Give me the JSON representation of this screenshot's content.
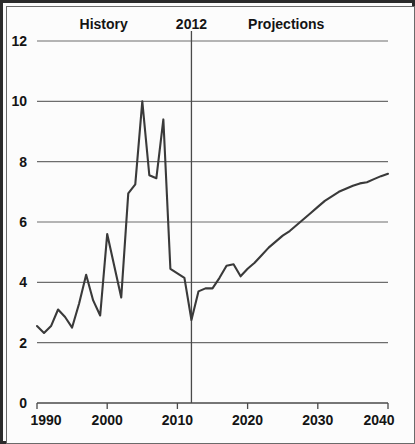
{
  "chart_data": {
    "type": "line",
    "title": "",
    "subtitle": "",
    "xlabel": "",
    "ylabel": "",
    "xlim": [
      1990,
      2040
    ],
    "ylim": [
      0,
      12
    ],
    "grid": true,
    "legend_position": "none",
    "x_ticks": [
      "1990",
      "2000",
      "2010",
      "2020",
      "2030",
      "2040"
    ],
    "x_tick_values": [
      1990,
      2000,
      2010,
      2020,
      2030,
      2040
    ],
    "y_ticks": [
      "0",
      "2",
      "4",
      "6",
      "8",
      "10",
      "12"
    ],
    "y_tick_values": [
      0,
      2,
      4,
      6,
      8,
      10,
      12
    ],
    "annotations": [
      {
        "name": "history-label",
        "text": "History",
        "x": 1999.5,
        "y": 12.55
      },
      {
        "name": "projection-year-label",
        "text": "2012",
        "x": 2012.0,
        "y": 12.55
      },
      {
        "name": "projections-label",
        "text": "Projections",
        "x": 2025.5,
        "y": 12.55
      }
    ],
    "divider": {
      "name": "projection-divider",
      "x": 2012,
      "orientation": "vertical"
    },
    "series": [
      {
        "name": "value",
        "x": [
          1990,
          1991,
          1992,
          1993,
          1994,
          1995,
          1996,
          1997,
          1998,
          1999,
          2000,
          2001,
          2002,
          2003,
          2004,
          2005,
          2006,
          2007,
          2008,
          2009,
          2010,
          2011,
          2012,
          2013,
          2014,
          2015,
          2016,
          2017,
          2018,
          2019,
          2020,
          2021,
          2022,
          2023,
          2024,
          2025,
          2026,
          2027,
          2028,
          2029,
          2030,
          2031,
          2032,
          2033,
          2034,
          2035,
          2036,
          2037,
          2038,
          2039,
          2040
        ],
        "values": [
          2.55,
          2.32,
          2.55,
          3.1,
          2.85,
          2.5,
          3.3,
          4.25,
          3.4,
          2.9,
          5.6,
          4.55,
          3.5,
          6.95,
          7.25,
          10.0,
          7.55,
          7.45,
          9.4,
          4.45,
          4.3,
          4.15,
          2.75,
          3.7,
          3.8,
          3.8,
          4.15,
          4.55,
          4.6,
          4.2,
          4.45,
          4.65,
          4.9,
          5.15,
          5.35,
          5.55,
          5.7,
          5.9,
          6.1,
          6.3,
          6.5,
          6.7,
          6.85,
          7.0,
          7.1,
          7.2,
          7.28,
          7.32,
          7.42,
          7.52,
          7.6
        ]
      }
    ]
  }
}
